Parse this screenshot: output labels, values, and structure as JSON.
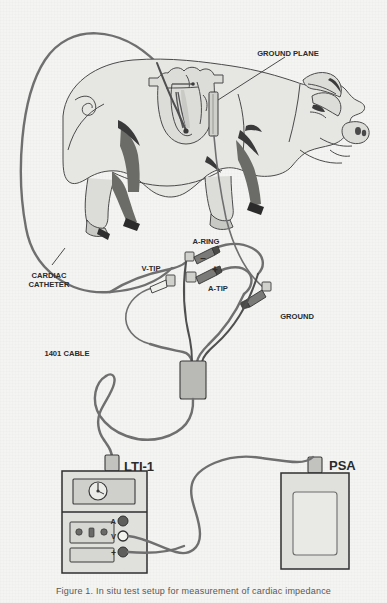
{
  "figure": {
    "domain": "scientific-illustration",
    "caption": "Figure 1. In situ test setup for measurement of cardiac impedance",
    "background_color": "#f4f4f2",
    "ink_color": "#3a3a3a",
    "fill_light": "#d9d9d6",
    "fill_mid": "#b9b9b6",
    "fill_dark": "#6e6e6c",
    "fill_darkest": "#2e2e2e"
  },
  "labels": {
    "ground_plane": "GROUND PLANE",
    "cardiac_catheter_line1": "CARDIAC",
    "cardiac_catheter_line2": "CATHETER",
    "a_ring": "A-RING",
    "a_ring_polarity": "–",
    "v_tip": "V-TIP",
    "a_tip": "A-TIP",
    "a_tip_polarity": "+",
    "ground": "GROUND",
    "cable_1401": "1401 CABLE",
    "lti_device": "LTI-1",
    "psa_device": "PSA"
  },
  "lti_panel": {
    "terminals": [
      {
        "name": "a-terminal",
        "label": "A",
        "style": "filled"
      },
      {
        "name": "v-terminal",
        "label": "V",
        "style": "open"
      },
      {
        "name": "plus-terminal",
        "label": "+",
        "style": "filled"
      }
    ],
    "meter": {
      "name": "dial-gauge",
      "type": "rotary-dial"
    },
    "keypad_buttons": 3
  },
  "psa_panel": {
    "screen": {
      "name": "psa-display",
      "type": "blank-rectangle"
    }
  },
  "anatomy": {
    "animal": "pig",
    "organ": "heart",
    "heart_chambers_shown": true
  },
  "connections": [
    {
      "from": "cardiac-catheter",
      "to": "a-ring-connector"
    },
    {
      "from": "cardiac-catheter",
      "to": "v-tip-connector"
    },
    {
      "from": "cardiac-catheter",
      "to": "a-tip-connector"
    },
    {
      "from": "ground-plane",
      "to": "ground-connector"
    },
    {
      "from": "junction-box",
      "to": "lti-1"
    },
    {
      "from": "lti-1-v-terminal",
      "to": "psa"
    },
    {
      "from": "lti-1-plus-terminal",
      "to": "psa"
    }
  ]
}
